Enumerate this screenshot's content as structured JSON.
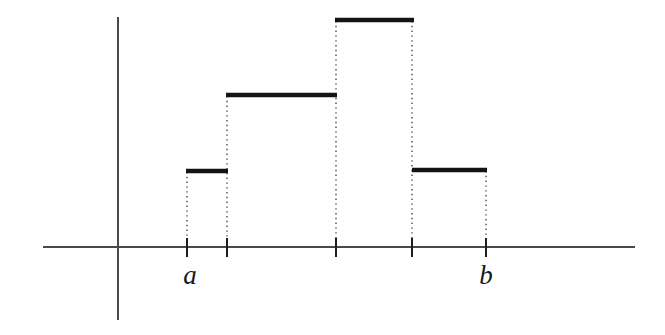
{
  "figure": {
    "kind": "step-function-diagram",
    "background_color": "#ffffff",
    "ink_color": "#141414",
    "axis_color": "#4a4a4a",
    "dotted_color": "#585858",
    "width": 665,
    "height": 335,
    "labels": [
      {
        "name": "label-a",
        "text": "a",
        "x": 190,
        "y": 262
      },
      {
        "name": "label-b",
        "text": "b",
        "x": 486,
        "y": 262
      }
    ]
  },
  "chart_data": {
    "type": "bar",
    "title": "",
    "subtitle": "",
    "xlabel": "",
    "ylabel": "",
    "grid": false,
    "legend": null,
    "style": "step-function with dotted drop lines",
    "baseline_y_px": 247,
    "axis": {
      "x_axis": {
        "x_start_px": 43,
        "x_end_px": 635,
        "y_px": 247
      },
      "y_axis": {
        "x_px": 118,
        "y_top_px": 17,
        "y_bottom_px": 320
      }
    },
    "categories": [
      "[a, x1]",
      "[x1, x2]",
      "[x2, x3]",
      "[x3, b]"
    ],
    "values": [
      76,
      152,
      227,
      77
    ],
    "tick_labels": [
      "a",
      "",
      "",
      "",
      "b"
    ],
    "partition_points_px": [
      187,
      227,
      336,
      412,
      486
    ],
    "bars": [
      {
        "index": 0,
        "x_left_px": 186,
        "x_right_px": 228,
        "top_y_px": 171,
        "height_px": 76
      },
      {
        "index": 1,
        "x_left_px": 226,
        "x_right_px": 337,
        "top_y_px": 95,
        "height_px": 152
      },
      {
        "index": 2,
        "x_left_px": 335,
        "x_right_px": 414,
        "top_y_px": 20,
        "height_px": 227
      },
      {
        "index": 3,
        "x_left_px": 412,
        "x_right_px": 487,
        "top_y_px": 170,
        "height_px": 77
      }
    ],
    "ticks_px": [
      187,
      227,
      336,
      412,
      486
    ],
    "annotations": [
      {
        "text": "a",
        "x_px": 190,
        "y_px": 280
      },
      {
        "text": "b",
        "x_px": 486,
        "y_px": 280
      }
    ]
  }
}
